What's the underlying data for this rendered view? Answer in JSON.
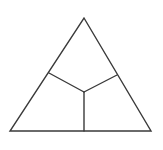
{
  "diagram": {
    "type": "triangle-partition",
    "stroke_color": "#3a3a3a",
    "background": "#ffffff",
    "vertices": {
      "apex": [
        84,
        18
      ],
      "bottom_left": [
        10,
        131
      ],
      "bottom_right": [
        151,
        131
      ]
    },
    "interior_point": [
      84,
      92
    ],
    "divider_endpoints": {
      "left_side": [
        49,
        73
      ],
      "right_side": [
        117,
        75
      ],
      "bottom_side": [
        84,
        131
      ]
    },
    "regions": 3
  }
}
